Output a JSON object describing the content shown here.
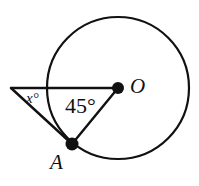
{
  "figure": {
    "kind": "circle-geometry-diagram",
    "background_color": "#ffffff",
    "stroke_color": "#111111",
    "width": 199,
    "height": 186
  },
  "circle": {
    "name": "main-circle",
    "center_x": 118,
    "center_y": 88,
    "radius": 71,
    "stroke_width": 2.2,
    "fill": "none"
  },
  "points": {
    "center": {
      "label": "O",
      "x": 118,
      "y": 88,
      "dot_radius": 6,
      "filled": true
    },
    "on_circle": {
      "label": "A",
      "x": 72,
      "y": 144,
      "dot_radius": 6.5,
      "filled": true
    },
    "external_vertex": {
      "label": "",
      "x": 11,
      "y": 88,
      "dot_radius": 0,
      "filled": false
    }
  },
  "segments": [
    {
      "name": "segment-vertex-to-O",
      "x1": 11,
      "y1": 88,
      "x2": 118,
      "y2": 88,
      "stroke_width": 2.4
    },
    {
      "name": "segment-vertex-to-A",
      "x1": 11,
      "y1": 88,
      "x2": 72,
      "y2": 144,
      "stroke_width": 2.4
    },
    {
      "name": "segment-O-to-A",
      "x1": 118,
      "y1": 88,
      "x2": 72,
      "y2": 144,
      "stroke_width": 2.4
    }
  ],
  "labels": {
    "center_point": "O",
    "circle_point": "A",
    "angle_at_center": "45°",
    "angle_at_vertex": "x°"
  }
}
